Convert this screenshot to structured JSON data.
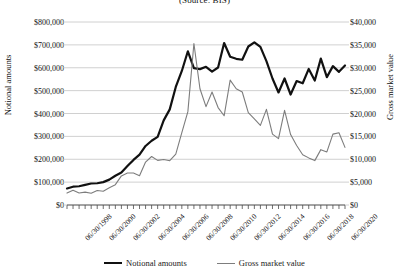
{
  "chart_data": {
    "type": "line",
    "title": "(Source: BIS)",
    "xlabel": "",
    "ylabel": "Notional amounts",
    "y2label": "Gross market value",
    "ylim": [
      0,
      800000
    ],
    "y2lim": [
      0,
      40000
    ],
    "ytick_labels": [
      "$800,000",
      "$700,000",
      "$600,000",
      "$500,000",
      "$400,000",
      "$300,000",
      "$200,000",
      "$100,000",
      "$0"
    ],
    "ytick_values": [
      800000,
      700000,
      600000,
      500000,
      400000,
      300000,
      200000,
      100000,
      0
    ],
    "y2tick_labels": [
      "$40,000",
      "$35,000",
      "$30,000",
      "$25,000",
      "$20,000",
      "$15,000",
      "$10,000",
      "$5,000",
      "$0"
    ],
    "y2tick_values": [
      40000,
      35000,
      30000,
      25000,
      20000,
      15000,
      10000,
      5000,
      0
    ],
    "grid": true,
    "legend_position": "bottom",
    "x_tick_labels": [
      "06/30/1998",
      "06/30/2000",
      "06/30/2002",
      "06/30/2004",
      "06/30/2006",
      "06/30/2008",
      "06/30/2010",
      "06/30/2012",
      "06/30/2014",
      "06/30/2016",
      "06/30/2018",
      "06/30/2020"
    ],
    "x_tick_indices": [
      0,
      4,
      8,
      12,
      16,
      20,
      24,
      28,
      32,
      36,
      40,
      44
    ],
    "x": [
      "06/30/1998",
      "12/31/1998",
      "06/30/1999",
      "12/31/1999",
      "06/30/2000",
      "12/31/2000",
      "06/30/2001",
      "12/31/2001",
      "06/30/2002",
      "12/31/2002",
      "06/30/2003",
      "12/31/2003",
      "06/30/2004",
      "12/31/2004",
      "06/30/2005",
      "12/31/2005",
      "06/30/2006",
      "12/31/2006",
      "06/30/2007",
      "12/31/2007",
      "06/30/2008",
      "12/31/2008",
      "06/30/2009",
      "12/31/2009",
      "06/30/2010",
      "12/31/2010",
      "06/30/2011",
      "12/31/2011",
      "06/30/2012",
      "12/31/2012",
      "06/30/2013",
      "12/31/2013",
      "06/30/2014",
      "12/31/2014",
      "06/30/2015",
      "12/31/2015",
      "06/30/2016",
      "12/31/2016",
      "06/30/2017",
      "12/31/2017",
      "06/30/2018",
      "12/31/2018",
      "06/30/2019",
      "12/31/2019",
      "06/30/2020",
      "12/31/2020",
      "06/30/2021"
    ],
    "series": [
      {
        "name": "Notional amounts",
        "axis": "left",
        "color": "#111111",
        "width": 2.2,
        "values": [
          72000,
          80000,
          82000,
          88000,
          94000,
          95000,
          100000,
          111000,
          128000,
          142000,
          170000,
          197000,
          220000,
          258000,
          281000,
          298000,
          370000,
          418000,
          516000,
          586000,
          672000,
          598000,
          594000,
          604000,
          583000,
          601000,
          708000,
          648000,
          639000,
          635000,
          693000,
          711000,
          691000,
          629000,
          553000,
          492000,
          553000,
          483000,
          542000,
          532000,
          595000,
          544000,
          640000,
          559000,
          607000,
          582000,
          610000
        ]
      },
      {
        "name": "Gross market value",
        "axis": "right",
        "color": "#7d7d7d",
        "width": 1.1,
        "values": [
          2600,
          3230,
          2630,
          2810,
          2580,
          3180,
          3020,
          3780,
          4450,
          6360,
          6990,
          6990,
          6400,
          9380,
          10600,
          9750,
          9940,
          9690,
          11100,
          15800,
          20400,
          35300,
          25400,
          21500,
          24700,
          21300,
          19500,
          27300,
          25400,
          24700,
          20200,
          18800,
          17400,
          20900,
          15500,
          14500,
          20700,
          15400,
          13000,
          11000,
          10300,
          9700,
          12100,
          11600,
          15500,
          15800,
          12600
        ]
      }
    ]
  },
  "legend": {
    "entries": [
      {
        "label": "Notional amounts"
      },
      {
        "label": "Gross market value"
      }
    ]
  }
}
